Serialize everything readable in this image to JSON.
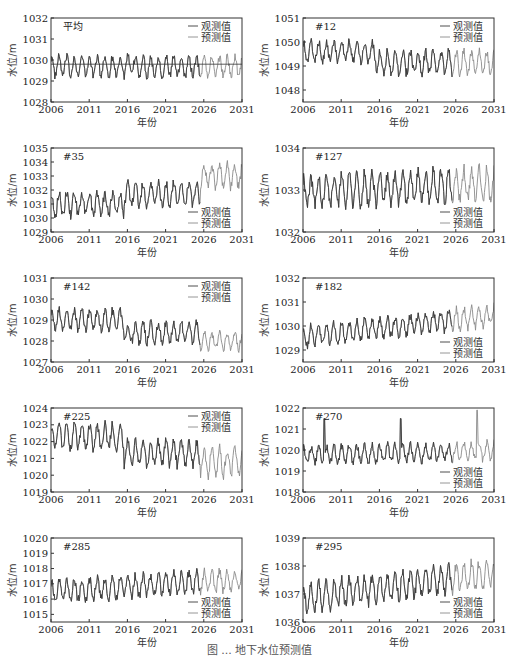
{
  "figure": {
    "caption": "图 ... 地下水位预测值",
    "xlabel": "年份",
    "ylabel": "水位/m",
    "legend": {
      "observed": "观测值",
      "predicted": "预测值"
    },
    "colors": {
      "observed": "#3a3a3a",
      "predicted": "#8a8a8a",
      "frame": "#333333"
    }
  },
  "chart_data": [
    {
      "type": "line",
      "title": "平均",
      "xlabel": "年份",
      "ylabel": "水位/m",
      "x_ticks": [
        2006,
        2011,
        2016,
        2021,
        2026,
        2031
      ],
      "xlim": [
        2006,
        2031
      ],
      "y_ticks": [
        1028,
        1029,
        1030,
        1031,
        1032
      ],
      "ylim": [
        1028,
        1032
      ],
      "legend_position": "upper-right",
      "series": [
        {
          "name": "观测值",
          "x_range": [
            2006,
            2025.5
          ],
          "mean": 1029.7,
          "amplitude": 0.45,
          "trend": 0.0
        },
        {
          "name": "预测值",
          "x_range": [
            2006,
            2031
          ],
          "mean": 1029.75,
          "amplitude": 0.45,
          "trend": 0.2
        }
      ],
      "annotations": [
        {
          "type": "hline",
          "y": 1029.8,
          "label": "mean level"
        }
      ]
    },
    {
      "type": "line",
      "title": "#12",
      "xlabel": "年份",
      "ylabel": "水位/m",
      "x_ticks": [
        2006,
        2011,
        2016,
        2021,
        2026,
        2031
      ],
      "xlim": [
        2006,
        2031
      ],
      "y_ticks": [
        1048,
        1049,
        1050,
        1051
      ],
      "ylim": [
        1047.5,
        1051
      ],
      "legend_position": "upper-right",
      "series": [
        {
          "name": "观测值",
          "x_range": [
            2006,
            2025.5
          ],
          "segments": [
            {
              "x": [
                2006,
                2015.5
              ],
              "mean": 1049.6,
              "amplitude": 0.4
            },
            {
              "x": [
                2015.5,
                2031
              ],
              "mean": 1049.15,
              "amplitude": 0.45
            }
          ]
        },
        {
          "name": "预测值",
          "x_range": [
            2006,
            2031
          ]
        }
      ]
    },
    {
      "type": "line",
      "title": "#35",
      "xlabel": "年份",
      "ylabel": "水位/m",
      "x_ticks": [
        2006,
        2011,
        2016,
        2021,
        2026,
        2031
      ],
      "xlim": [
        2006,
        2031
      ],
      "y_ticks": [
        1029,
        1030,
        1031,
        1032,
        1033,
        1034,
        1035
      ],
      "ylim": [
        1029,
        1035
      ],
      "legend_position": "lower-right",
      "series": [
        {
          "name": "观测值",
          "x_range": [
            2006,
            2025.5
          ],
          "segments": [
            {
              "x": [
                2006,
                2015.5
              ],
              "mean": 1031.0,
              "amplitude": 0.8
            },
            {
              "x": [
                2015.5,
                2025.5
              ],
              "mean": 1031.7,
              "amplitude": 0.8
            },
            {
              "x": [
                2025.5,
                2031
              ],
              "mean": 1033.0,
              "amplitude": 0.8
            }
          ]
        },
        {
          "name": "预测值",
          "x_range": [
            2006,
            2031
          ]
        }
      ]
    },
    {
      "type": "line",
      "title": "#127",
      "xlabel": "年份",
      "ylabel": "水位/m",
      "x_ticks": [
        2006,
        2011,
        2016,
        2021,
        2026,
        2031
      ],
      "xlim": [
        2006,
        2031
      ],
      "y_ticks": [
        1032,
        1033,
        1034
      ],
      "ylim": [
        1032,
        1034
      ],
      "legend_position": "lower-right",
      "series": [
        {
          "name": "观测值",
          "x_range": [
            2006,
            2025.5
          ],
          "mean": 1032.95,
          "amplitude": 0.35,
          "trend": 0.2
        },
        {
          "name": "预测值",
          "x_range": [
            2006,
            2031
          ]
        }
      ]
    },
    {
      "type": "line",
      "title": "#142",
      "xlabel": "年份",
      "ylabel": "水位/m",
      "x_ticks": [
        2006,
        2011,
        2016,
        2021,
        2026,
        2031
      ],
      "xlim": [
        2006,
        2031
      ],
      "y_ticks": [
        1027,
        1028,
        1029,
        1030,
        1031
      ],
      "ylim": [
        1027,
        1031
      ],
      "legend_position": "upper-right",
      "series": [
        {
          "name": "观测值",
          "x_range": [
            2006,
            2025.5
          ],
          "segments": [
            {
              "x": [
                2006,
                2015.5
              ],
              "mean": 1029.0,
              "amplitude": 0.45
            },
            {
              "x": [
                2015.5,
                2025.5
              ],
              "mean": 1028.4,
              "amplitude": 0.45
            },
            {
              "x": [
                2025.5,
                2031
              ],
              "mean": 1028.0,
              "amplitude": 0.4
            }
          ]
        },
        {
          "name": "预测值",
          "x_range": [
            2006,
            2031
          ]
        }
      ]
    },
    {
      "type": "line",
      "title": "#182",
      "xlabel": "年份",
      "ylabel": "水位/m",
      "x_ticks": [
        2006,
        2011,
        2016,
        2021,
        2026,
        2031
      ],
      "xlim": [
        2006,
        2031
      ],
      "y_ticks": [
        1029,
        1030,
        1031,
        1032
      ],
      "ylim": [
        1028.5,
        1032
      ],
      "legend_position": "lower-right",
      "series": [
        {
          "name": "观测值",
          "x_range": [
            2006,
            2025.5
          ],
          "mean": 1029.55,
          "amplitude": 0.4,
          "trend": 0.9
        },
        {
          "name": "预测值",
          "x_range": [
            2006,
            2031
          ]
        }
      ]
    },
    {
      "type": "line",
      "title": "#225",
      "xlabel": "年份",
      "ylabel": "水位/m",
      "x_ticks": [
        2006,
        2011,
        2016,
        2021,
        2026,
        2031
      ],
      "xlim": [
        2006,
        2031
      ],
      "y_ticks": [
        1019,
        1020,
        1021,
        1022,
        1023,
        1024
      ],
      "ylim": [
        1019,
        1024
      ],
      "legend_position": "upper-right",
      "series": [
        {
          "name": "观测值",
          "x_range": [
            2006,
            2025.5
          ],
          "segments": [
            {
              "x": [
                2006,
                2015.5
              ],
              "mean": 1022.3,
              "amplitude": 0.7
            },
            {
              "x": [
                2015.5,
                2025.5
              ],
              "mean": 1021.3,
              "amplitude": 0.7
            },
            {
              "x": [
                2025.5,
                2031
              ],
              "mean": 1020.8,
              "amplitude": 0.75
            }
          ]
        },
        {
          "name": "预测值",
          "x_range": [
            2006,
            2031
          ]
        }
      ]
    },
    {
      "type": "line",
      "title": "#270",
      "xlabel": "年份",
      "ylabel": "水位/m",
      "x_ticks": [
        2006,
        2011,
        2016,
        2021,
        2026,
        2031
      ],
      "xlim": [
        2006,
        2031
      ],
      "y_ticks": [
        1018,
        1019,
        1020,
        1021,
        1022
      ],
      "ylim": [
        1018,
        1022
      ],
      "legend_position": "lower-right",
      "series": [
        {
          "name": "观测值",
          "x_range": [
            2006,
            2025.5
          ],
          "mean": 1019.75,
          "amplitude": 0.4,
          "trend": 0.2,
          "spikes": [
            {
              "x": 2008.8,
              "y": 1021.5
            },
            {
              "x": 2018.8,
              "y": 1021.5
            },
            {
              "x": 2028.8,
              "y": 1021.9
            }
          ]
        },
        {
          "name": "预测值",
          "x_range": [
            2006,
            2031
          ]
        }
      ]
    },
    {
      "type": "line",
      "title": "#285",
      "xlabel": "年份",
      "ylabel": "水位/m",
      "x_ticks": [
        2006,
        2011,
        2016,
        2021,
        2026,
        2031
      ],
      "xlim": [
        2006,
        2031
      ],
      "y_ticks": [
        1015,
        1016,
        1017,
        1018,
        1019,
        1020
      ],
      "ylim": [
        1014.5,
        1020
      ],
      "legend_position": "lower-right",
      "series": [
        {
          "name": "观测值",
          "x_range": [
            2006,
            2025.5
          ],
          "mean": 1016.5,
          "amplitude": 0.65,
          "trend": 0.8
        },
        {
          "name": "预测值",
          "x_range": [
            2006,
            2031
          ]
        }
      ]
    },
    {
      "type": "line",
      "title": "#295",
      "xlabel": "年份",
      "ylabel": "水位/m",
      "x_ticks": [
        2006,
        2011,
        2016,
        2021,
        2026,
        2031
      ],
      "xlim": [
        2006,
        2031
      ],
      "y_ticks": [
        1036,
        1037,
        1038,
        1039
      ],
      "ylim": [
        1036,
        1039
      ],
      "legend_position": "lower-right",
      "series": [
        {
          "name": "观测值",
          "x_range": [
            2006,
            2025.5
          ],
          "mean": 1036.85,
          "amplitude": 0.45,
          "trend": 0.9
        },
        {
          "name": "预测值",
          "x_range": [
            2006,
            2031
          ]
        }
      ]
    }
  ]
}
